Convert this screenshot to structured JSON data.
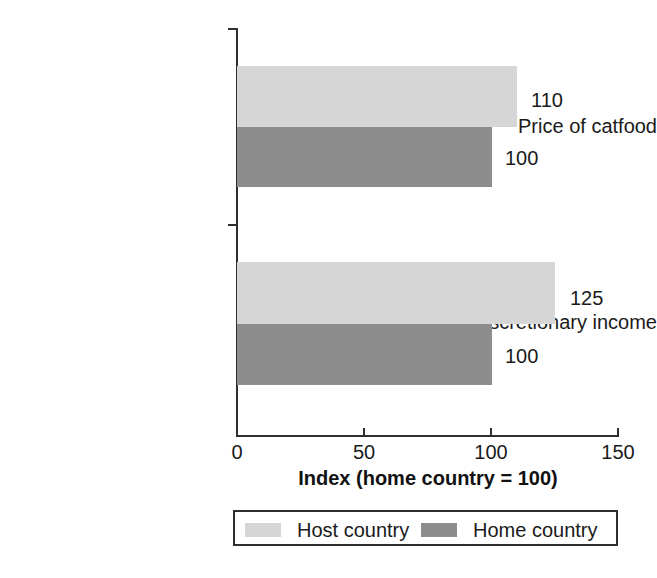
{
  "chart_data": {
    "type": "bar",
    "orientation": "horizontal",
    "title": "",
    "xlabel": "Index (home country = 100)",
    "ylabel": "",
    "xlim": [
      0,
      150
    ],
    "xticks": [
      0,
      50,
      100,
      150
    ],
    "xtick_labels": [
      "0",
      "50",
      "100",
      "150"
    ],
    "grid": false,
    "categories": [
      "Price of catfood",
      "Discretionary income"
    ],
    "series": [
      {
        "name": "Host country",
        "color": "#d6d6d6",
        "values": [
          110,
          125
        ],
        "value_labels": [
          "110",
          "125"
        ]
      },
      {
        "name": "Home country",
        "color": "#8d8d8d",
        "values": [
          100,
          100
        ],
        "value_labels": [
          "100",
          "100"
        ]
      }
    ],
    "legend_position": "bottom"
  },
  "axis": {
    "title": "Index (home country = 100)",
    "ticks": [
      {
        "label": "0",
        "value": 0
      },
      {
        "label": "50",
        "value": 50
      },
      {
        "label": "100",
        "value": 100
      },
      {
        "label": "150",
        "value": 150
      }
    ]
  },
  "categories": [
    {
      "label": "Price of catfood"
    },
    {
      "label": "Discretionary income"
    }
  ],
  "bars": [
    {
      "name": "catfood-host",
      "series": "Host country",
      "category": "Price of catfood",
      "value": 110,
      "label": "110"
    },
    {
      "name": "catfood-home",
      "series": "Home country",
      "category": "Price of catfood",
      "value": 100,
      "label": "100"
    },
    {
      "name": "income-host",
      "series": "Host country",
      "category": "Discretionary income",
      "value": 125,
      "label": "125"
    },
    {
      "name": "income-home",
      "series": "Home country",
      "category": "Discretionary income",
      "value": 100,
      "label": "100"
    }
  ],
  "legend": {
    "entries": [
      {
        "label": "Host country",
        "color": "#d6d6d6",
        "swatch": "host-country-swatch"
      },
      {
        "label": "Home country",
        "color": "#8d8d8d",
        "swatch": "home-country-swatch"
      }
    ]
  },
  "colors": {
    "host": "#d6d6d6",
    "home": "#8d8d8d",
    "axis": "#2e2e2e",
    "text": "#1a1a1a",
    "background": "#ffffff"
  }
}
